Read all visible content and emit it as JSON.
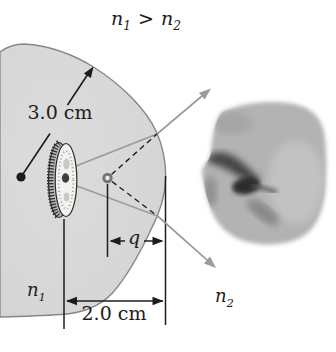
{
  "labels": {
    "relation": {
      "n1": "n",
      "n1_sub": "1",
      "gt": ">",
      "n2": "n",
      "n2_sub": "2"
    },
    "radius": "3.0 cm",
    "distance": "2.0 cm",
    "q": "q",
    "n1": "n",
    "n1_sub": "1",
    "n2": "n",
    "n2_sub": "2"
  },
  "colors": {
    "background": "#ffffff",
    "sphere_fill": "#d8d8d8",
    "sphere_stroke": "#868686",
    "ray_gray": "#9b9b9b",
    "ink": "#1c1c1c",
    "image_point_ring": "#757575",
    "coin_face": "#f3f2ee",
    "photo_gray": "#b3b3b3"
  }
}
